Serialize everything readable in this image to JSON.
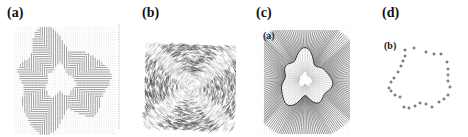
{
  "figure": {
    "panels": [
      {
        "id": "a",
        "label": "(a)",
        "description": "dense vector field around irregular blob"
      },
      {
        "id": "b",
        "label": "(b)",
        "description": "dark line-integral texture"
      },
      {
        "id": "c",
        "label": "(c)",
        "sublabel": "(a)",
        "description": "radial streamline field around irregular contour"
      },
      {
        "id": "d",
        "label": "(d)",
        "sublabel": "(b)",
        "description": "closed contour of cross markers"
      }
    ],
    "colors": {
      "ink": "#222222",
      "grid": "#cfcfcf",
      "texture": "#3a3a3a",
      "background": "#ffffff"
    },
    "crosses": [
      [
        405,
        50
      ],
      [
        414,
        48
      ],
      [
        426,
        52
      ],
      [
        434,
        54
      ],
      [
        441,
        54
      ],
      [
        447,
        62
      ],
      [
        448,
        69
      ],
      [
        448,
        75
      ],
      [
        448,
        81
      ],
      [
        450,
        87
      ],
      [
        448,
        95
      ],
      [
        444,
        99
      ],
      [
        439,
        102
      ],
      [
        432,
        107
      ],
      [
        426,
        104
      ],
      [
        420,
        103
      ],
      [
        415,
        106
      ],
      [
        409,
        108
      ],
      [
        404,
        107
      ],
      [
        400,
        97
      ],
      [
        395,
        95
      ],
      [
        391,
        91
      ],
      [
        389,
        88
      ],
      [
        391,
        82
      ],
      [
        394,
        78
      ],
      [
        398,
        72
      ],
      [
        401,
        66
      ],
      [
        403,
        61
      ],
      [
        405,
        56
      ]
    ]
  }
}
